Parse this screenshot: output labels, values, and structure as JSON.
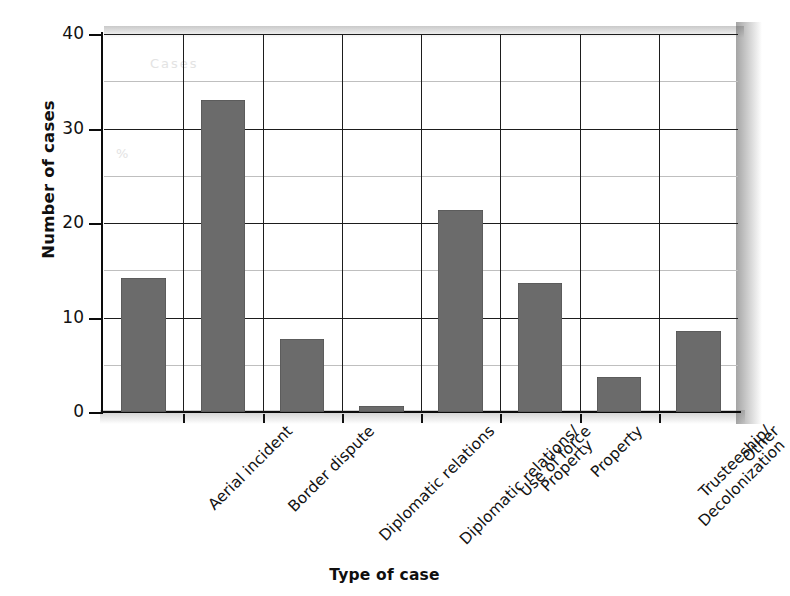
{
  "chart_data": {
    "type": "bar",
    "title": "",
    "xlabel": "Type of case",
    "ylabel": "Number of cases",
    "categories": [
      "Aerial incident",
      "Border dispute",
      "Diplomatic relations",
      "Diplomatic relations/ Property",
      "Use of force",
      "Property",
      "Trusteeship/ Decolonization",
      "Other"
    ],
    "category_lines": [
      [
        "Aerial incident"
      ],
      [
        "Border dispute"
      ],
      [
        "Diplomatic relations"
      ],
      [
        "Diplomatic relations/",
        "Property"
      ],
      [
        "Use of force"
      ],
      [
        "Property"
      ],
      [
        "Trusteeship/",
        "Decolonization"
      ],
      [
        "Other"
      ]
    ],
    "values": [
      14.2,
      33.0,
      7.7,
      0.6,
      21.4,
      13.6,
      3.7,
      8.6
    ],
    "ylim": [
      0,
      40
    ],
    "ytick_labels": [
      "0",
      "10",
      "20",
      "30",
      "40"
    ],
    "ytick_values": [
      0,
      10,
      20,
      30,
      40
    ],
    "gridline_values": [
      5,
      10,
      15,
      20,
      25,
      30,
      35,
      40
    ],
    "major_gridline_values": [
      10,
      20,
      30,
      40
    ],
    "grid": true,
    "legend": "none",
    "bar_color": "#6b6b6b",
    "axis_color": "#0c0c0c",
    "gridline_color": "#bfbfbf"
  },
  "ghost_marks": {
    "top": "Cases",
    "mid": "%"
  }
}
